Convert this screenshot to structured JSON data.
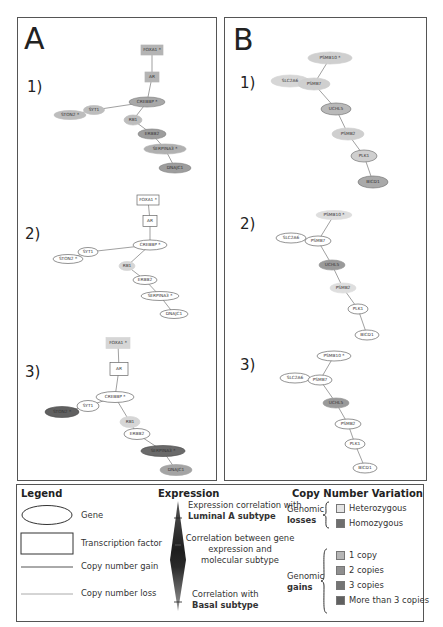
{
  "panels": [
    {
      "letter": "A",
      "graphs": [
        {
          "label": "1)",
          "nodes": [
            {
              "id": "FOXA1",
              "label": "FOXA1 *",
              "shape": "rect",
              "x": 152,
              "y": 50,
              "w": 22,
              "h": 10,
              "fill": "#b4b4b4",
              "stroke": "#b4b4b4"
            },
            {
              "id": "AR",
              "label": "AR",
              "shape": "rect",
              "x": 152,
              "y": 77,
              "w": 14,
              "h": 10,
              "fill": "#b4b4b4",
              "stroke": "#b4b4b4"
            },
            {
              "id": "CREBBP",
              "label": "CREBBP *",
              "shape": "ellipse",
              "x": 147,
              "y": 102,
              "w": 36,
              "h": 10,
              "fill": "#a8a8a8",
              "stroke": "#888888"
            },
            {
              "id": "SYT1",
              "label": "SYT1",
              "shape": "ellipse",
              "x": 94,
              "y": 110,
              "w": 21,
              "h": 9,
              "fill": "#bdbdbd",
              "stroke": "#bdbdbd"
            },
            {
              "id": "STON2",
              "label": "STON2 *",
              "shape": "ellipse",
              "x": 70,
              "y": 115,
              "w": 32,
              "h": 9,
              "fill": "#bdbdbd",
              "stroke": "#bdbdbd"
            },
            {
              "id": "RB1",
              "label": "RB1",
              "shape": "ellipse",
              "x": 133,
              "y": 120,
              "w": 18,
              "h": 10,
              "fill": "#bdbdbd",
              "stroke": "#bdbdbd"
            },
            {
              "id": "ERBB2",
              "label": "ERBB2",
              "shape": "ellipse",
              "x": 152,
              "y": 134,
              "w": 28,
              "h": 10,
              "fill": "#9d9d9d",
              "stroke": "#888888"
            },
            {
              "id": "SERPINA3",
              "label": "SERPINA3 *",
              "shape": "ellipse",
              "x": 165,
              "y": 149,
              "w": 42,
              "h": 10,
              "fill": "#b0b0b0",
              "stroke": "#b0b0b0"
            },
            {
              "id": "DNAJC1",
              "label": "DNAJC1",
              "shape": "ellipse",
              "x": 175,
              "y": 168,
              "w": 32,
              "h": 10,
              "fill": "#9d9d9d",
              "stroke": "#888888"
            }
          ],
          "edges": [
            [
              "FOXA1",
              "AR"
            ],
            [
              "AR",
              "CREBBP"
            ],
            [
              "CREBBP",
              "SYT1"
            ],
            [
              "SYT1",
              "STON2"
            ],
            [
              "CREBBP",
              "RB1"
            ],
            [
              "RB1",
              "ERBB2"
            ],
            [
              "ERBB2",
              "SERPINA3"
            ],
            [
              "SERPINA3",
              "DNAJC1"
            ]
          ]
        },
        {
          "label": "2)",
          "nodes": [
            {
              "id": "FOXA1",
              "label": "FOXA1 *",
              "shape": "rect",
              "x": 148,
              "y": 200,
              "w": 22,
              "h": 10,
              "fill": "#ffffff",
              "stroke": "#666666"
            },
            {
              "id": "AR",
              "label": "AR",
              "shape": "rect",
              "x": 150,
              "y": 221,
              "w": 14,
              "h": 11,
              "fill": "#ffffff",
              "stroke": "#666666"
            },
            {
              "id": "CREBBP",
              "label": "CREBBP *",
              "shape": "ellipse",
              "x": 150,
              "y": 245,
              "w": 34,
              "h": 10,
              "fill": "#ffffff",
              "stroke": "#666666"
            },
            {
              "id": "SYT1",
              "label": "SYT1",
              "shape": "ellipse",
              "x": 88,
              "y": 252,
              "w": 20,
              "h": 9,
              "fill": "#ffffff",
              "stroke": "#666666"
            },
            {
              "id": "STON2",
              "label": "STON2 *",
              "shape": "ellipse",
              "x": 68,
              "y": 259,
              "w": 30,
              "h": 9,
              "fill": "#ffffff",
              "stroke": "#666666"
            },
            {
              "id": "RB1",
              "label": "RB1",
              "shape": "ellipse",
              "x": 127,
              "y": 266,
              "w": 16,
              "h": 9,
              "fill": "#d6d6d6",
              "stroke": "#d6d6d6"
            },
            {
              "id": "ERBB2",
              "label": "ERBB2",
              "shape": "ellipse",
              "x": 145,
              "y": 280,
              "w": 24,
              "h": 9,
              "fill": "#ffffff",
              "stroke": "#666666"
            },
            {
              "id": "SERPINA3",
              "label": "SERPINA3 *",
              "shape": "ellipse",
              "x": 160,
              "y": 296,
              "w": 38,
              "h": 9,
              "fill": "#ffffff",
              "stroke": "#666666"
            },
            {
              "id": "DNAJC1",
              "label": "DNAJC1",
              "shape": "ellipse",
              "x": 174,
              "y": 314,
              "w": 28,
              "h": 9,
              "fill": "#ffffff",
              "stroke": "#666666"
            }
          ],
          "edges": [
            [
              "FOXA1",
              "AR"
            ],
            [
              "AR",
              "CREBBP"
            ],
            [
              "CREBBP",
              "SYT1"
            ],
            [
              "SYT1",
              "STON2"
            ],
            [
              "CREBBP",
              "RB1"
            ],
            [
              "RB1",
              "ERBB2"
            ],
            [
              "ERBB2",
              "SERPINA3"
            ],
            [
              "SERPINA3",
              "DNAJC1"
            ]
          ]
        },
        {
          "label": "3)",
          "nodes": [
            {
              "id": "FOXA1",
              "label": "FOXA1 *",
              "shape": "rect",
              "x": 118,
              "y": 343,
              "w": 24,
              "h": 11,
              "fill": "#d6d6d6",
              "stroke": "#d6d6d6"
            },
            {
              "id": "AR",
              "label": "AR",
              "shape": "rect",
              "x": 119,
              "y": 369,
              "w": 18,
              "h": 13,
              "fill": "#ffffff",
              "stroke": "#666666"
            },
            {
              "id": "CREBBP",
              "label": "CREBBP *",
              "shape": "ellipse",
              "x": 115,
              "y": 397,
              "w": 38,
              "h": 11,
              "fill": "#ffffff",
              "stroke": "#666666"
            },
            {
              "id": "SYT1",
              "label": "SYT1",
              "shape": "ellipse",
              "x": 88,
              "y": 406,
              "w": 22,
              "h": 11,
              "fill": "#ffffff",
              "stroke": "#666666"
            },
            {
              "id": "STON2",
              "label": "STON2 *",
              "shape": "ellipse",
              "x": 62,
              "y": 412,
              "w": 34,
              "h": 11,
              "fill": "#606060",
              "stroke": "#505050"
            },
            {
              "id": "RB1",
              "label": "RB1",
              "shape": "ellipse",
              "x": 130,
              "y": 422,
              "w": 20,
              "h": 11,
              "fill": "#d6d6d6",
              "stroke": "#d6d6d6"
            },
            {
              "id": "ERBB2",
              "label": "ERBB2",
              "shape": "ellipse",
              "x": 137,
              "y": 434,
              "w": 26,
              "h": 11,
              "fill": "#ffffff",
              "stroke": "#666666"
            },
            {
              "id": "SERPINA3",
              "label": "SERPINA3 *",
              "shape": "ellipse",
              "x": 163,
              "y": 451,
              "w": 44,
              "h": 11,
              "fill": "#6a6a6a",
              "stroke": "#505050"
            },
            {
              "id": "DNAJC1",
              "label": "DNAJC1",
              "shape": "ellipse",
              "x": 176,
              "y": 470,
              "w": 32,
              "h": 11,
              "fill": "#a4a4a4",
              "stroke": "#a4a4a4"
            }
          ],
          "edges": [
            [
              "FOXA1",
              "AR"
            ],
            [
              "AR",
              "CREBBP"
            ],
            [
              "CREBBP",
              "SYT1"
            ],
            [
              "SYT1",
              "STON2"
            ],
            [
              "CREBBP",
              "RB1"
            ],
            [
              "RB1",
              "ERBB2"
            ],
            [
              "ERBB2",
              "SERPINA3"
            ],
            [
              "SERPINA3",
              "DNAJC1"
            ]
          ]
        }
      ]
    },
    {
      "letter": "B",
      "graphs": [
        {
          "label": "1)",
          "nodes": [
            {
              "id": "PSMB10",
              "label": "PSMB10 *",
              "shape": "ellipse",
              "x": 330,
              "y": 58,
              "w": 44,
              "h": 12,
              "fill": "#cfcfcf",
              "stroke": "#cfcfcf"
            },
            {
              "id": "SLC2A6",
              "label": "SLC2A6",
              "shape": "ellipse",
              "x": 290,
              "y": 81,
              "w": 38,
              "h": 12,
              "fill": "#d6d6d6",
              "stroke": "#d6d6d6"
            },
            {
              "id": "PSMB7",
              "label": "PSMB7",
              "shape": "ellipse",
              "x": 314,
              "y": 84,
              "w": 32,
              "h": 12,
              "fill": "#cfcfcf",
              "stroke": "#cfcfcf"
            },
            {
              "id": "UCHL5",
              "label": "UCHL5",
              "shape": "ellipse",
              "x": 336,
              "y": 109,
              "w": 30,
              "h": 12,
              "fill": "#b9b9b9",
              "stroke": "#777777"
            },
            {
              "id": "PSMB2",
              "label": "PSMB2",
              "shape": "ellipse",
              "x": 348,
              "y": 134,
              "w": 32,
              "h": 12,
              "fill": "#cfcfcf",
              "stroke": "#cfcfcf"
            },
            {
              "id": "PLK1",
              "label": "PLK1",
              "shape": "ellipse",
              "x": 364,
              "y": 156,
              "w": 26,
              "h": 12,
              "fill": "#cfcfcf",
              "stroke": "#777777"
            },
            {
              "id": "BICD1",
              "label": "BICD1",
              "shape": "ellipse",
              "x": 373,
              "y": 182,
              "w": 30,
              "h": 12,
              "fill": "#a9a9a9",
              "stroke": "#777777"
            }
          ],
          "edges": [
            [
              "PSMB10",
              "PSMB7"
            ],
            [
              "PSMB7",
              "SLC2A6"
            ],
            [
              "PSMB7",
              "UCHL5"
            ],
            [
              "UCHL5",
              "PSMB2"
            ],
            [
              "PSMB2",
              "PLK1"
            ],
            [
              "PLK1",
              "BICD1"
            ]
          ]
        },
        {
          "label": "2)",
          "nodes": [
            {
              "id": "PSMB10",
              "label": "PSMB10 *",
              "shape": "ellipse",
              "x": 334,
              "y": 215,
              "w": 36,
              "h": 9,
              "fill": "#dedede",
              "stroke": "#dedede"
            },
            {
              "id": "SLC2A6",
              "label": "SLC2A6",
              "shape": "ellipse",
              "x": 291,
              "y": 238,
              "w": 30,
              "h": 10,
              "fill": "#ffffff",
              "stroke": "#666666"
            },
            {
              "id": "PSMB7",
              "label": "PSMB7",
              "shape": "ellipse",
              "x": 318,
              "y": 241,
              "w": 26,
              "h": 10,
              "fill": "#ffffff",
              "stroke": "#666666"
            },
            {
              "id": "UCHL5",
              "label": "UCHL5",
              "shape": "ellipse",
              "x": 332,
              "y": 265,
              "w": 26,
              "h": 10,
              "fill": "#9a9a9a",
              "stroke": "#9a9a9a"
            },
            {
              "id": "PSMB2",
              "label": "PSMB2",
              "shape": "ellipse",
              "x": 343,
              "y": 288,
              "w": 26,
              "h": 10,
              "fill": "#dedede",
              "stroke": "#dedede"
            },
            {
              "id": "PLK1",
              "label": "PLK1",
              "shape": "ellipse",
              "x": 358,
              "y": 309,
              "w": 20,
              "h": 10,
              "fill": "#ffffff",
              "stroke": "#666666"
            },
            {
              "id": "BICD1",
              "label": "BICD1",
              "shape": "ellipse",
              "x": 367,
              "y": 335,
              "w": 24,
              "h": 10,
              "fill": "#ffffff",
              "stroke": "#666666"
            }
          ],
          "edges": [
            [
              "PSMB10",
              "PSMB7"
            ],
            [
              "PSMB7",
              "SLC2A6"
            ],
            [
              "PSMB7",
              "UCHL5"
            ],
            [
              "UCHL5",
              "PSMB2"
            ],
            [
              "PSMB2",
              "PLK1"
            ],
            [
              "PLK1",
              "BICD1"
            ]
          ]
        },
        {
          "label": "3)",
          "nodes": [
            {
              "id": "PSMB10",
              "label": "PSMB10 *",
              "shape": "ellipse",
              "x": 334,
              "y": 356,
              "w": 34,
              "h": 10,
              "fill": "#ffffff",
              "stroke": "#666666"
            },
            {
              "id": "SLC2A6",
              "label": "SLC2A6",
              "shape": "ellipse",
              "x": 295,
              "y": 378,
              "w": 30,
              "h": 10,
              "fill": "#ffffff",
              "stroke": "#666666"
            },
            {
              "id": "PSMB7",
              "label": "PSMB7",
              "shape": "ellipse",
              "x": 320,
              "y": 380,
              "w": 24,
              "h": 10,
              "fill": "#ffffff",
              "stroke": "#666666"
            },
            {
              "id": "UCHL5",
              "label": "UCHL5",
              "shape": "ellipse",
              "x": 336,
              "y": 403,
              "w": 26,
              "h": 10,
              "fill": "#9a9a9a",
              "stroke": "#9a9a9a"
            },
            {
              "id": "PSMB2",
              "label": "PSMB2",
              "shape": "ellipse",
              "x": 348,
              "y": 424,
              "w": 26,
              "h": 10,
              "fill": "#ffffff",
              "stroke": "#666666"
            },
            {
              "id": "PLK1",
              "label": "PLK1",
              "shape": "ellipse",
              "x": 355,
              "y": 444,
              "w": 20,
              "h": 10,
              "fill": "#ffffff",
              "stroke": "#666666"
            },
            {
              "id": "BICD1",
              "label": "BICD1",
              "shape": "ellipse",
              "x": 365,
              "y": 468,
              "w": 24,
              "h": 10,
              "fill": "#ffffff",
              "stroke": "#666666"
            }
          ],
          "edges": [
            [
              "PSMB10",
              "PSMB7"
            ],
            [
              "PSMB7",
              "SLC2A6"
            ],
            [
              "PSMB7",
              "UCHL5"
            ],
            [
              "UCHL5",
              "PSMB2"
            ],
            [
              "PSMB2",
              "PLK1"
            ],
            [
              "PLK1",
              "BICD1"
            ]
          ]
        }
      ]
    }
  ],
  "legend": {
    "title": "Legend",
    "shapes": [
      {
        "label": "Gene"
      },
      {
        "label": "Transcription factor"
      },
      {
        "label": "Copy number gain"
      },
      {
        "label": "Copy number loss"
      }
    ],
    "expression": {
      "title": "Expression",
      "top_line1": "Expression correlation with",
      "top_line2": "Luminal A subtype",
      "mid_line1": "Correlation between gene",
      "mid_line2": "expression and",
      "mid_line3": "molecular subtype",
      "bottom_line1": "Correlation with",
      "bottom_line2": "Basal subtype"
    },
    "cnv": {
      "title": "Copy Number Variation",
      "losses_label1": "Genomic",
      "losses_label2": "losses",
      "losses": [
        {
          "label": "Heterozygous",
          "color": "#e4e4e4"
        },
        {
          "label": "Homozygous",
          "color": "#6e6e6e"
        }
      ],
      "gains_label1": "Genomic",
      "gains_label2": "gains",
      "gains": [
        {
          "label": "1 copy",
          "color": "#b6b6b6"
        },
        {
          "label": "2 copies",
          "color": "#8f8f8f"
        },
        {
          "label": "3 copies",
          "color": "#747474"
        },
        {
          "label": "More than 3 copies",
          "color": "#606060"
        }
      ]
    }
  }
}
